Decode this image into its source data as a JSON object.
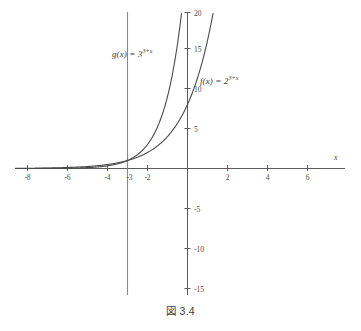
{
  "caption": "図 3.4",
  "chart_data": {
    "type": "line",
    "title": "",
    "xlabel": "x",
    "ylabel": "",
    "xlim": [
      -8.6,
      7.4
    ],
    "ylim": [
      -18.5,
      21.5
    ],
    "grid": false,
    "legend": "inline-annotations",
    "x_ticks": [
      -8,
      -6,
      -4,
      -3,
      -2,
      2,
      4,
      6
    ],
    "x_tick_labels": [
      "-8",
      "-6",
      "-4",
      "-3",
      "-2",
      "2",
      "4",
      "6"
    ],
    "y_ticks": [
      -15,
      -10,
      -5,
      5,
      10,
      15,
      20
    ],
    "y_tick_labels": [
      "-15",
      "-10",
      "-5",
      "5",
      "10",
      "15",
      "20"
    ],
    "vertical_reference_line": {
      "x": -3,
      "label": ""
    },
    "series": [
      {
        "name": "f",
        "label_base": "f(x) = 2",
        "label_exponent": "3+x",
        "formula": "f(x) = 2^(3+x)",
        "base": 2,
        "shift": 3,
        "y_at_x0": 8,
        "x": [
          -8.6,
          -8,
          -7,
          -6,
          -5,
          -4,
          -3,
          -2,
          -1,
          0,
          0.5,
          1,
          1.4
        ],
        "values": [
          0.022,
          0.031,
          0.063,
          0.125,
          0.25,
          0.5,
          1,
          2,
          4,
          8,
          11.3,
          16,
          21.1
        ]
      },
      {
        "name": "g",
        "label_base": "g(x) = 3",
        "label_exponent": "3+x",
        "formula": "g(x) = 3^(3+x)",
        "base": 3,
        "shift": 3,
        "y_at_x0": 27,
        "x": [
          -8.6,
          -8,
          -7,
          -6,
          -5,
          -4,
          -3,
          -2,
          -1,
          -0.5,
          -0.2,
          0
        ],
        "values": [
          0.0015,
          0.0046,
          0.0137,
          0.041,
          0.123,
          0.37,
          1,
          3,
          9,
          15.6,
          21.1,
          27
        ]
      }
    ],
    "axis_label_x": "x"
  }
}
